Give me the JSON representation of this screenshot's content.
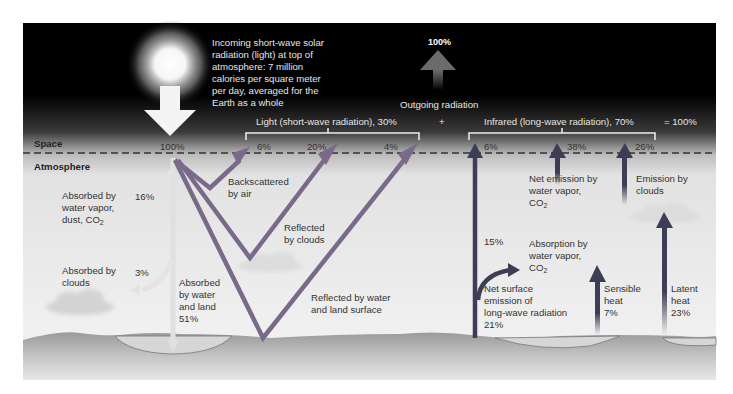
{
  "colors": {
    "space_black": "#000000",
    "atmosphere_gray": "#eeeeee",
    "shortwave_arrow": "#7a6a8a",
    "longwave_arrow": "#3d3d55",
    "incoming_arrow": "#f4f4f4",
    "absorbed_arrow": "#e4e4e4",
    "ground": "#b8b8b8"
  },
  "title_text": {
    "incoming_line1": "Incoming short-wave solar",
    "incoming_line2": "radiation (light) at top of",
    "incoming_line3": "atmosphere: 7 million",
    "incoming_line4": "calories per square meter",
    "incoming_line5": "per day, averaged for the",
    "incoming_line6": "Earth as a whole"
  },
  "outgoing": {
    "percent": "100%",
    "label": "Outgoing radiation",
    "plus": "+",
    "equals": "= 100%"
  },
  "layers": {
    "space": "Space",
    "atmosphere": "Atmosphere"
  },
  "shortwave": {
    "bracket_label": "Light (short-wave radiation), 30%",
    "incoming_percent": "100%",
    "backscatter_percent": "6%",
    "cloud_reflect_percent": "20%",
    "surface_reflect_percent": "4%",
    "backscatter_l1": "Backscattered",
    "backscatter_l2": "by air",
    "cloud_reflect_l1": "Reflected",
    "cloud_reflect_l2": "by clouds",
    "surface_reflect_l1": "Reflected by water",
    "surface_reflect_l2": "and land surface",
    "absorbed_vapor_l1": "Absorbed by",
    "absorbed_vapor_l2": "water vapor,",
    "absorbed_vapor_l3": "dust, CO",
    "absorbed_vapor_sub": "2",
    "absorbed_vapor_percent": "16%",
    "absorbed_clouds_l1": "Absorbed by",
    "absorbed_clouds_l2": "clouds",
    "absorbed_clouds_percent": "3%",
    "absorbed_surface_l1": "Absorbed",
    "absorbed_surface_l2": "by water",
    "absorbed_surface_l3": "and land",
    "absorbed_surface_percent": "51%"
  },
  "longwave": {
    "bracket_label": "Infrared (long-wave radiation), 70%",
    "surface_direct_percent": "6%",
    "vapor_emission_percent": "38%",
    "cloud_emission_percent": "26%",
    "vapor_emission_l1": "Net emission by",
    "vapor_emission_l2": "water vapor,",
    "vapor_emission_l3": "CO",
    "vapor_emission_sub": "2",
    "cloud_emission_l1": "Emission by",
    "cloud_emission_l2": "clouds",
    "absorption_percent": "15%",
    "absorption_l1": "Absorption by",
    "absorption_l2": "water vapor,",
    "absorption_l3": "CO",
    "absorption_sub": "2",
    "net_surface_l1": "Net surface",
    "net_surface_l2": "emission of",
    "net_surface_l3": "long-wave radiation",
    "net_surface_percent": "21%",
    "sensible_l1": "Sensible",
    "sensible_l2": "heat",
    "sensible_percent": "7%",
    "latent_l1": "Latent",
    "latent_l2": "heat",
    "latent_percent": "23%"
  }
}
